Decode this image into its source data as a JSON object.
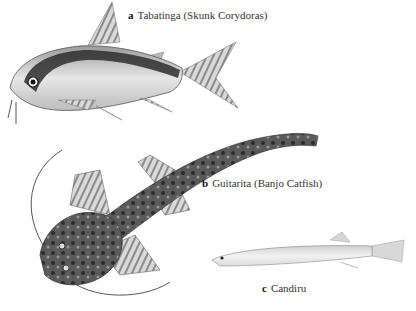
{
  "figure": {
    "items": [
      {
        "letter": "a",
        "name": "Tabatinga (Skunk Corydoras)"
      },
      {
        "letter": "b",
        "name": "Guitarita (Banjo Catfish)"
      },
      {
        "letter": "c",
        "name": "Candiru"
      }
    ]
  },
  "colors": {
    "background": "#ffffff",
    "ink_dark": "#2a2a2a",
    "ink_mid": "#7a7a7a",
    "ink_light": "#c8c8c8"
  }
}
